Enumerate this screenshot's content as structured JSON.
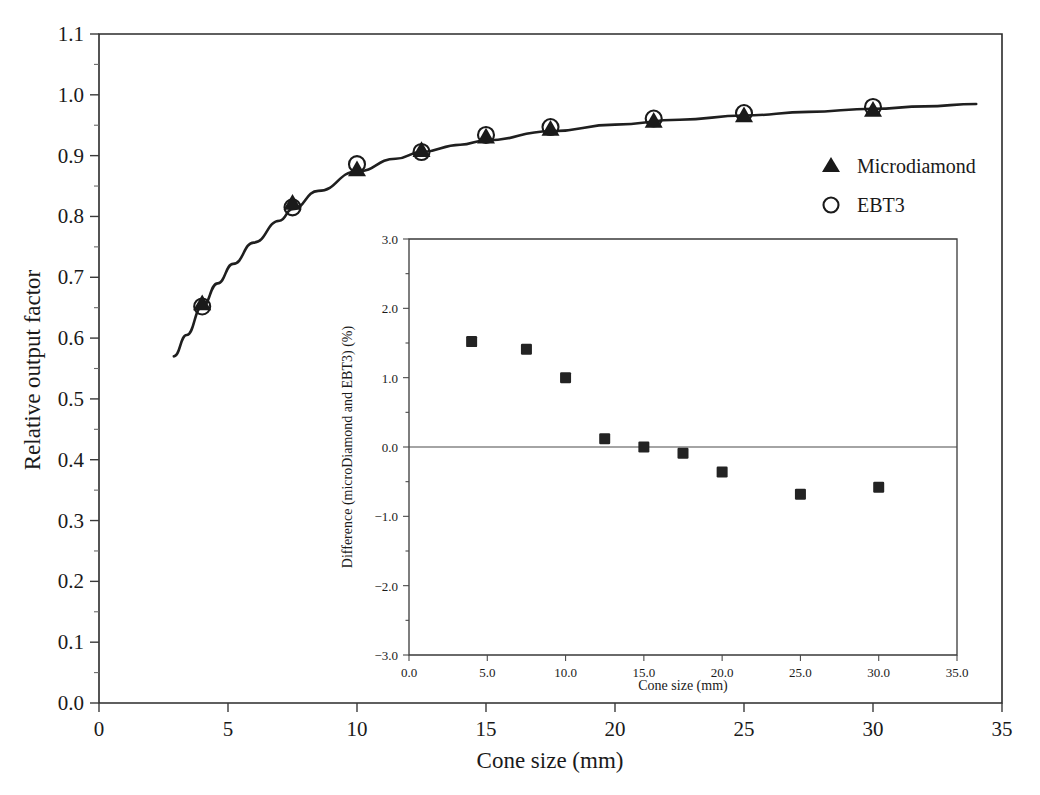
{
  "figure": {
    "background_color": "#ffffff",
    "ink_color": "#1a1a1a"
  },
  "main_axes": {
    "xlabel": "Cone size (mm)",
    "ylabel": "Relative output factor",
    "xticks": [
      "0",
      "5",
      "10",
      "15",
      "20",
      "25",
      "30",
      "35"
    ],
    "yticks": [
      "0.0",
      "0.1",
      "0.2",
      "0.3",
      "0.4",
      "0.5",
      "0.6",
      "0.7",
      "0.8",
      "0.9",
      "1.0",
      "1.1"
    ]
  },
  "legend": {
    "entries": [
      {
        "marker": "filled-triangle",
        "label": "Microdiamond"
      },
      {
        "marker": "open-circle",
        "label": "EBT3"
      }
    ]
  },
  "inset_axes": {
    "xlabel": "Cone size (mm)",
    "ylabel": "Difference (microDiamond and EBT3) (%)",
    "xticks": [
      "0.0",
      "5.0",
      "10.0",
      "15.0",
      "20.0",
      "25.0",
      "30.0",
      "35.0"
    ],
    "yticks": [
      "3.0",
      "2.0",
      "1.0",
      "0.0",
      "-1.0",
      "-2.0",
      "-3.0"
    ]
  },
  "chart_data": [
    {
      "type": "scatter",
      "id": "main-plot",
      "title": "",
      "xlabel": "Cone size (mm)",
      "ylabel": "Relative output factor",
      "xlim": [
        0,
        35
      ],
      "ylim": [
        0.0,
        1.1
      ],
      "xticks": [
        0,
        5,
        10,
        15,
        20,
        25,
        30,
        35
      ],
      "yticks": [
        0.0,
        0.1,
        0.2,
        0.3,
        0.4,
        0.5,
        0.6,
        0.7,
        0.8,
        0.9,
        1.0,
        1.1
      ],
      "grid": false,
      "legend_position": "right-middle",
      "x": [
        4.0,
        7.5,
        10.0,
        12.5,
        15.0,
        17.5,
        21.5,
        25.0,
        30.0
      ],
      "series": [
        {
          "name": "Microdiamond",
          "marker": "filled-triangle",
          "values": [
            0.657,
            0.822,
            0.877,
            0.909,
            0.931,
            0.944,
            0.957,
            0.966,
            0.975
          ]
        },
        {
          "name": "EBT3",
          "marker": "open-circle",
          "values": [
            0.652,
            0.815,
            0.886,
            0.906,
            0.934,
            0.947,
            0.961,
            0.97,
            0.98
          ]
        }
      ],
      "fit_curve": {
        "name": "fitted curve",
        "x": [
          2.9,
          3.4,
          4.0,
          4.6,
          5.2,
          6.0,
          7.0,
          7.5,
          8.5,
          10.0,
          11.5,
          12.5,
          14.0,
          15.0,
          17.5,
          20.0,
          22.5,
          25.0,
          27.5,
          30.0,
          32.0,
          34.0
        ],
        "y": [
          0.57,
          0.605,
          0.652,
          0.69,
          0.722,
          0.757,
          0.793,
          0.812,
          0.842,
          0.874,
          0.895,
          0.906,
          0.918,
          0.925,
          0.94,
          0.951,
          0.959,
          0.966,
          0.972,
          0.977,
          0.981,
          0.985
        ]
      }
    },
    {
      "type": "scatter",
      "id": "inset-plot",
      "title": "",
      "xlabel": "Cone size (mm)",
      "ylabel": "Difference (microDiamond and EBT3) (%)",
      "xlim": [
        0.0,
        35.0
      ],
      "ylim": [
        -3.0,
        3.0
      ],
      "xticks": [
        0.0,
        5.0,
        10.0,
        15.0,
        20.0,
        25.0,
        30.0,
        35.0
      ],
      "yticks": [
        -3.0,
        -2.0,
        -1.0,
        0.0,
        1.0,
        2.0,
        3.0
      ],
      "grid": false,
      "zero_line": true,
      "marker": "filled-square",
      "x": [
        4.0,
        7.5,
        10.0,
        12.5,
        15.0,
        17.5,
        20.0,
        25.0,
        30.0
      ],
      "values": [
        1.52,
        1.41,
        1.0,
        0.12,
        0.0,
        -0.09,
        -0.36,
        -0.68,
        -0.58
      ]
    }
  ]
}
